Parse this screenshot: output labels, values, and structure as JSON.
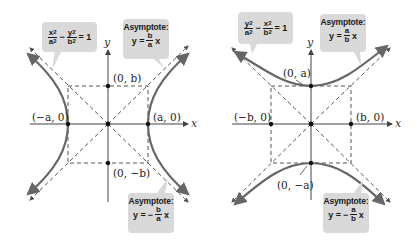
{
  "figures": [
    {
      "name": "horizontal-hyperbola",
      "equation": {
        "term1_num": "x",
        "term1_den": "a",
        "op": "−",
        "term2_num": "y",
        "term2_den": "b",
        "exp": "2",
        "rhs": "= 1"
      },
      "asymptote_pos": {
        "title": "Asymptote:",
        "lhs": "y =",
        "sign": "",
        "num": "b",
        "den": "a",
        "var": "x"
      },
      "asymptote_neg": {
        "title": "Asymptote:",
        "lhs": "y =",
        "sign": "−",
        "num": "b",
        "den": "a",
        "var": "x"
      },
      "labels": {
        "vertex_right": "(a, 0)",
        "vertex_left": "(−a, 0)",
        "covertex_top": "(0, b)",
        "covertex_bottom": "(0, −b)",
        "x_axis": "x",
        "y_axis": "y"
      }
    },
    {
      "name": "vertical-hyperbola",
      "equation": {
        "term1_num": "y",
        "term1_den": "a",
        "op": "−",
        "term2_num": "x",
        "term2_den": "b",
        "exp": "2",
        "rhs": "= 1"
      },
      "asymptote_pos": {
        "title": "Asymptote:",
        "lhs": "y =",
        "sign": "",
        "num": "a",
        "den": "b",
        "var": "x"
      },
      "asymptote_neg": {
        "title": "Asymptote:",
        "lhs": "y =",
        "sign": "−",
        "num": "a",
        "den": "b",
        "var": "x"
      },
      "labels": {
        "vertex_top": "(0, a)",
        "vertex_bottom": "(0, −a)",
        "covertex_left": "(−b, 0)",
        "covertex_right": "(b, 0)",
        "x_axis": "x",
        "y_axis": "y"
      }
    }
  ],
  "colors": {
    "curve": "#666666",
    "axis": "#444444",
    "dashed": "#555555",
    "callout_bg": "#d9d9d9",
    "point": "#111111"
  }
}
